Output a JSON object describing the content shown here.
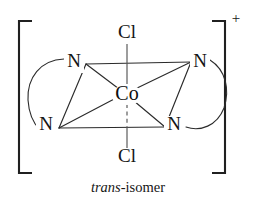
{
  "figure": {
    "kind": "coordination-complex-structure",
    "caption_italic": "trans",
    "caption_roman": "-isomer",
    "caption_full": "trans-isomer",
    "charge": "+",
    "metal": {
      "symbol": "Co",
      "name": "cobalt-center"
    },
    "axial_ligands": [
      {
        "symbol": "Cl",
        "position": "top",
        "bond_style": "solid"
      },
      {
        "symbol": "Cl",
        "position": "bottom",
        "bond_style": "dashed"
      }
    ],
    "equatorial_ligands": [
      {
        "symbol": "N",
        "position": "upper-left"
      },
      {
        "symbol": "N",
        "position": "upper-right"
      },
      {
        "symbol": "N",
        "position": "lower-left"
      },
      {
        "symbol": "N",
        "position": "lower-right"
      }
    ],
    "chelate_arcs": [
      {
        "side": "left",
        "connects": [
          "upper-left",
          "lower-left"
        ]
      },
      {
        "side": "right",
        "connects": [
          "upper-right",
          "lower-right"
        ]
      }
    ],
    "brackets": {
      "left": "[",
      "right": "]"
    },
    "colors": {
      "line": "#2b2b2b",
      "axial_line": "#555555",
      "bracket": "#202020",
      "text": "#141414",
      "background": "#ffffff"
    }
  }
}
